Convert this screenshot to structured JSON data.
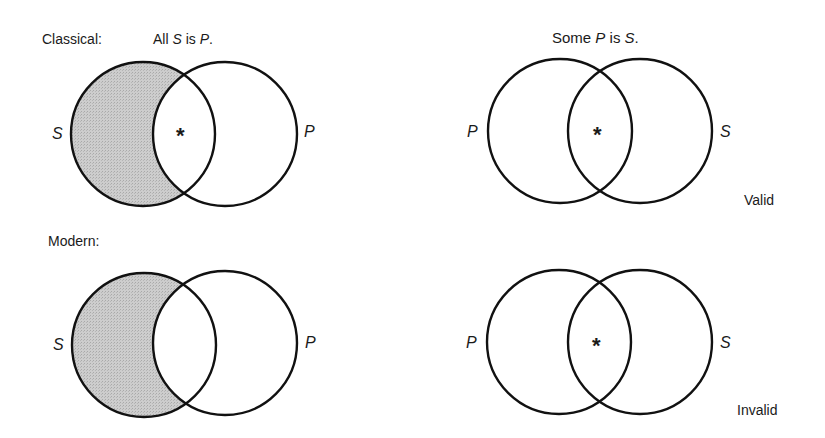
{
  "labels": {
    "classical": "Classical:",
    "modern": "Modern:",
    "valid": "Valid",
    "invalid": "Invalid"
  },
  "premise": {
    "prefix": "All ",
    "subject": "S",
    "copula": " is ",
    "predicate": "P",
    "end": "."
  },
  "conclusion": {
    "prefix": "Some ",
    "subject": "P",
    "copula": " is ",
    "predicate": "S",
    "end": "."
  },
  "diagrams": [
    {
      "id": "classical-premise",
      "left_label": "S",
      "right_label": "P",
      "shaded_region": "S minus P",
      "marker": "*",
      "marker_region": "S and P"
    },
    {
      "id": "classical-conclusion",
      "left_label": "P",
      "right_label": "S",
      "shaded_region": "none",
      "marker": "*",
      "marker_region": "P and S",
      "verdict": "Valid"
    },
    {
      "id": "modern-premise",
      "left_label": "S",
      "right_label": "P",
      "shaded_region": "S minus P",
      "marker": "",
      "marker_region": "none"
    },
    {
      "id": "modern-conclusion",
      "left_label": "P",
      "right_label": "S",
      "shaded_region": "none",
      "marker": "*",
      "marker_region": "P and S",
      "verdict": "Invalid"
    }
  ],
  "colors": {
    "shade": "#c6c6c6",
    "stroke": "#111111",
    "background": "#ffffff"
  }
}
